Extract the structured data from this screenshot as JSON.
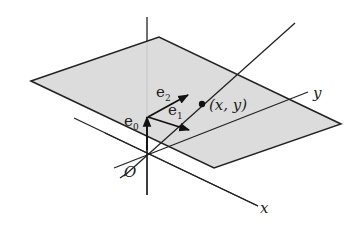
{
  "diagram": {
    "type": "3d-geometry-figure",
    "colors": {
      "plane_fill": "#d9d9d9",
      "line": "#222222",
      "background": "#ffffff"
    },
    "labels": {
      "x_axis": "x",
      "y_axis": "y",
      "origin": "O",
      "point": "(x, y)",
      "e0": "e",
      "e0_sub": "0",
      "e1": "e",
      "e1_sub": "1",
      "e2": "e",
      "e2_sub": "2"
    },
    "elements": [
      "shaded plane (parallelogram)",
      "vertical axis through O",
      "x axis",
      "y axis",
      "line from O through point (x, y)",
      "vector e0 (vertical)",
      "vector e1",
      "vector e2",
      "point (x, y) on plane"
    ]
  }
}
